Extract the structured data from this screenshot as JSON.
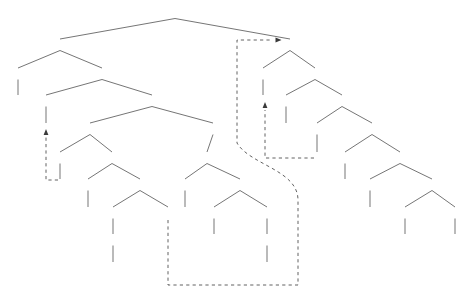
{
  "diagram": {
    "type": "syntax-tree",
    "line_color": "#3a3a3a",
    "text_color": "#1a1a1a",
    "sentence": "Kim wrote an article on her typewriter that will change the field"
  },
  "nodes": [
    {
      "id": "n0",
      "label": "IP",
      "kind": "cat",
      "x": 175,
      "y": 13
    },
    {
      "id": "n1",
      "label": "IP",
      "kind": "cat",
      "x": 60,
      "y": 45
    },
    {
      "id": "n2",
      "label": "NP",
      "kind": "cat",
      "x": 18,
      "y": 74
    },
    {
      "id": "n3",
      "label": "I'",
      "kind": "cat",
      "x": 102,
      "y": 74
    },
    {
      "id": "n4",
      "label": "Kim",
      "kind": "word",
      "x": 18,
      "y": 101
    },
    {
      "id": "n5",
      "label": "I",
      "kind": "cat",
      "x": 46,
      "y": 101
    },
    {
      "id": "n6",
      "label": "wrote",
      "kind": "word",
      "x": 46,
      "y": 129
    },
    {
      "id": "n7",
      "label": "VP",
      "kind": "cat",
      "x": 152,
      "y": 101
    },
    {
      "id": "n8",
      "label": "VP",
      "kind": "cat",
      "x": 90,
      "y": 129
    },
    {
      "id": "n9",
      "label": "PP",
      "kind": "cat",
      "x": 213,
      "y": 129
    },
    {
      "id": "n10",
      "label": "V",
      "kind": "cat",
      "x": 60,
      "y": 158
    },
    {
      "id": "n11",
      "label": "NP",
      "kind": "cat",
      "x": 112,
      "y": 158
    },
    {
      "id": "n12",
      "label": "t",
      "kind": "trace",
      "x": 60,
      "y": 185
    },
    {
      "id": "n13",
      "label": "Det",
      "kind": "cat",
      "x": 88,
      "y": 185
    },
    {
      "id": "n14",
      "label": "N'",
      "kind": "cat",
      "x": 140,
      "y": 185
    },
    {
      "id": "n15",
      "label": "an",
      "kind": "word",
      "x": 88,
      "y": 213
    },
    {
      "id": "n16",
      "label": "N'",
      "kind": "cat",
      "x": 113,
      "y": 213
    },
    {
      "id": "n17",
      "label": "t",
      "kind": "trace",
      "x": 168,
      "y": 213
    },
    {
      "id": "n18",
      "label": "N",
      "kind": "cat",
      "x": 113,
      "y": 240
    },
    {
      "id": "n19",
      "label": "article",
      "kind": "word",
      "x": 113,
      "y": 268
    },
    {
      "id": "n20",
      "label": "P'",
      "kind": "cat",
      "x": 207,
      "y": 158
    },
    {
      "id": "n21",
      "label": "P",
      "kind": "cat",
      "x": 185,
      "y": 185
    },
    {
      "id": "n22",
      "label": "NP",
      "kind": "cat",
      "x": 240,
      "y": 185
    },
    {
      "id": "n23",
      "label": "on",
      "kind": "word",
      "x": 185,
      "y": 213
    },
    {
      "id": "n24",
      "label": "Det",
      "kind": "cat",
      "x": 214,
      "y": 213
    },
    {
      "id": "n25",
      "label": "N'",
      "kind": "cat",
      "x": 267,
      "y": 213
    },
    {
      "id": "n26",
      "label": "her",
      "kind": "word",
      "x": 214,
      "y": 240
    },
    {
      "id": "n27",
      "label": "N",
      "kind": "cat",
      "x": 267,
      "y": 240
    },
    {
      "id": "n28",
      "label": "typewriter",
      "kind": "word",
      "x": 267,
      "y": 268
    },
    {
      "id": "n29",
      "label": "CP",
      "kind": "cat",
      "x": 290,
      "y": 45
    },
    {
      "id": "n30",
      "label": "NP",
      "kind": "cat",
      "x": 263,
      "y": 74
    },
    {
      "id": "n31",
      "label": "C'",
      "kind": "cat",
      "x": 315,
      "y": 74
    },
    {
      "id": "n32",
      "label": "that",
      "kind": "word",
      "x": 263,
      "y": 101
    },
    {
      "id": "n33",
      "label": "C",
      "kind": "cat",
      "x": 286,
      "y": 101
    },
    {
      "id": "n34",
      "label": "IP",
      "kind": "cat",
      "x": 342,
      "y": 101
    },
    {
      "id": "n35",
      "label": "e",
      "kind": "trace",
      "x": 286,
      "y": 129
    },
    {
      "id": "n36",
      "label": "NP",
      "kind": "cat",
      "x": 317,
      "y": 129
    },
    {
      "id": "n37",
      "label": "I'",
      "kind": "cat",
      "x": 372,
      "y": 129
    },
    {
      "id": "n38",
      "label": "t",
      "kind": "trace",
      "x": 317,
      "y": 158
    },
    {
      "id": "n39",
      "label": "I",
      "kind": "cat",
      "x": 345,
      "y": 158
    },
    {
      "id": "n40",
      "label": "VP",
      "kind": "cat",
      "x": 400,
      "y": 158
    },
    {
      "id": "n41",
      "label": "will",
      "kind": "word",
      "x": 345,
      "y": 185
    },
    {
      "id": "n42",
      "label": "V",
      "kind": "cat",
      "x": 370,
      "y": 185
    },
    {
      "id": "n43",
      "label": "NP",
      "kind": "cat",
      "x": 432,
      "y": 185
    },
    {
      "id": "n44",
      "label": "change",
      "kind": "word",
      "x": 370,
      "y": 213
    },
    {
      "id": "n45",
      "label": "Det",
      "kind": "cat",
      "x": 405,
      "y": 213
    },
    {
      "id": "n46",
      "label": "N",
      "kind": "cat",
      "x": 455,
      "y": 213
    },
    {
      "id": "n47",
      "label": "the",
      "kind": "word",
      "x": 405,
      "y": 240
    },
    {
      "id": "n48",
      "label": "field",
      "kind": "word",
      "x": 455,
      "y": 240
    }
  ],
  "edges": [
    {
      "from": "n0",
      "to": "n1"
    },
    {
      "from": "n0",
      "to": "n29"
    },
    {
      "from": "n1",
      "to": "n2"
    },
    {
      "from": "n1",
      "to": "n3"
    },
    {
      "from": "n2",
      "to": "n4"
    },
    {
      "from": "n3",
      "to": "n5"
    },
    {
      "from": "n3",
      "to": "n7"
    },
    {
      "from": "n5",
      "to": "n6"
    },
    {
      "from": "n7",
      "to": "n8"
    },
    {
      "from": "n7",
      "to": "n9"
    },
    {
      "from": "n8",
      "to": "n10"
    },
    {
      "from": "n8",
      "to": "n11"
    },
    {
      "from": "n10",
      "to": "n12"
    },
    {
      "from": "n11",
      "to": "n13"
    },
    {
      "from": "n11",
      "to": "n14"
    },
    {
      "from": "n13",
      "to": "n15"
    },
    {
      "from": "n14",
      "to": "n16"
    },
    {
      "from": "n14",
      "to": "n17"
    },
    {
      "from": "n16",
      "to": "n18"
    },
    {
      "from": "n18",
      "to": "n19"
    },
    {
      "from": "n9",
      "to": "n20"
    },
    {
      "from": "n20",
      "to": "n21"
    },
    {
      "from": "n20",
      "to": "n22"
    },
    {
      "from": "n21",
      "to": "n23"
    },
    {
      "from": "n22",
      "to": "n24"
    },
    {
      "from": "n22",
      "to": "n25"
    },
    {
      "from": "n24",
      "to": "n26"
    },
    {
      "from": "n25",
      "to": "n27"
    },
    {
      "from": "n27",
      "to": "n28"
    },
    {
      "from": "n29",
      "to": "n30"
    },
    {
      "from": "n29",
      "to": "n31"
    },
    {
      "from": "n30",
      "to": "n32"
    },
    {
      "from": "n31",
      "to": "n33"
    },
    {
      "from": "n31",
      "to": "n34"
    },
    {
      "from": "n33",
      "to": "n35"
    },
    {
      "from": "n34",
      "to": "n36"
    },
    {
      "from": "n34",
      "to": "n37"
    },
    {
      "from": "n36",
      "to": "n38"
    },
    {
      "from": "n37",
      "to": "n39"
    },
    {
      "from": "n37",
      "to": "n40"
    },
    {
      "from": "n39",
      "to": "n41"
    },
    {
      "from": "n40",
      "to": "n42"
    },
    {
      "from": "n40",
      "to": "n43"
    },
    {
      "from": "n42",
      "to": "n44"
    },
    {
      "from": "n43",
      "to": "n45"
    },
    {
      "from": "n43",
      "to": "n46"
    },
    {
      "from": "n45",
      "to": "n47"
    },
    {
      "from": "n46",
      "to": "n48"
    }
  ],
  "movements": [
    {
      "name": "verb-raising",
      "from_label": "t",
      "to_label": "wrote",
      "path": "M 58,180 L 46,180 L 46,137",
      "arrow": {
        "x": 46,
        "y": 133,
        "dir": "up"
      }
    },
    {
      "name": "wh-movement-that",
      "from_label": "t",
      "to_label": "that",
      "path": "M 314,158 L 265,158 L 265,110",
      "arrow": {
        "x": 265,
        "y": 106,
        "dir": "up"
      }
    },
    {
      "name": "extraposition-relative-clause",
      "from_label": "t",
      "to_label": "CP",
      "path": "M 168,220 L 168,285 L 298,285 L 298,200 C 298,170 250,165 237,143 L 237,40 L 272,40",
      "arrow": {
        "x": 277,
        "y": 40,
        "dir": "right"
      }
    }
  ]
}
